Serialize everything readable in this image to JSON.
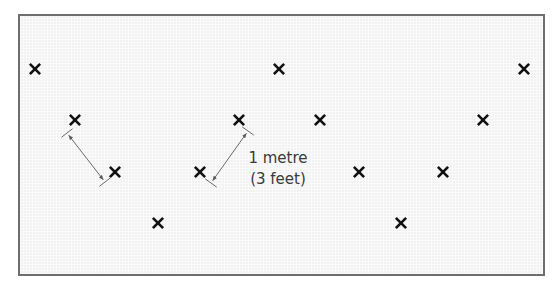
{
  "diagram": {
    "colors": {
      "background": "#f2f2f2",
      "frame": "#6e6e6e",
      "marker": "#111111",
      "dimension_line": "#6a6a6a",
      "label_text": "#3a3a3a"
    },
    "marker_symbol": "cross",
    "markers": [
      {
        "x": 35,
        "y": 69
      },
      {
        "x": 279,
        "y": 69
      },
      {
        "x": 524,
        "y": 69
      },
      {
        "x": 75,
        "y": 120
      },
      {
        "x": 239,
        "y": 120
      },
      {
        "x": 320,
        "y": 120
      },
      {
        "x": 483,
        "y": 120
      },
      {
        "x": 115,
        "y": 172
      },
      {
        "x": 200,
        "y": 172
      },
      {
        "x": 359,
        "y": 172
      },
      {
        "x": 443,
        "y": 172
      },
      {
        "x": 158,
        "y": 223
      },
      {
        "x": 401,
        "y": 223
      }
    ],
    "dimensions": [
      {
        "x1": 67,
        "y1": 133,
        "x2": 105,
        "y2": 182
      },
      {
        "x1": 248,
        "y1": 131,
        "x2": 211,
        "y2": 183
      }
    ],
    "label": {
      "line1": "1 metre",
      "line2": "(3 feet)"
    }
  }
}
